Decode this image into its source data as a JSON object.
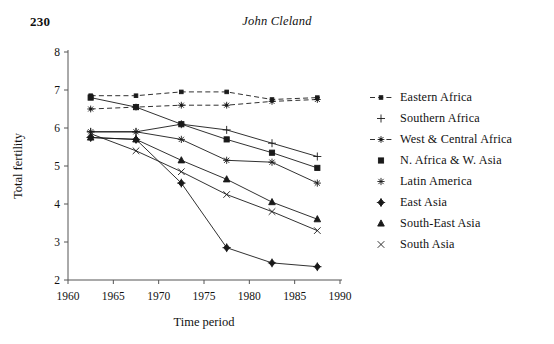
{
  "page": {
    "number": "230",
    "running_title": "John Cleland"
  },
  "chart_data": {
    "type": "line",
    "title": "",
    "xlabel": "Time period",
    "ylabel": "Total fertility",
    "xlim": [
      1960,
      1990
    ],
    "ylim": [
      2,
      8
    ],
    "xticks": [
      "1960",
      "1965",
      "1970",
      "1975",
      "1980",
      "1985",
      "1990"
    ],
    "yticks": [
      "2",
      "3",
      "4",
      "5",
      "6",
      "7",
      "8"
    ],
    "grid": false,
    "legend_position": "right",
    "x": [
      1962.5,
      1967.5,
      1972.5,
      1977.5,
      1982.5,
      1987.5
    ],
    "series": [
      {
        "name": "Eastern Africa",
        "marker": "small-square-dash",
        "linestyle": "dashed",
        "values": [
          6.85,
          6.85,
          6.95,
          6.95,
          6.75,
          6.8
        ]
      },
      {
        "name": "Southern Africa",
        "marker": "plus",
        "linestyle": "solid",
        "values": [
          5.9,
          5.9,
          6.1,
          5.95,
          5.6,
          5.25
        ]
      },
      {
        "name": "West & Central Africa",
        "marker": "asterisk",
        "linestyle": "dashed",
        "values": [
          6.5,
          6.55,
          6.6,
          6.6,
          6.7,
          6.75
        ]
      },
      {
        "name": "N. Africa & W. Asia",
        "marker": "filled-square",
        "linestyle": "solid",
        "values": [
          6.8,
          6.55,
          6.1,
          5.7,
          5.35,
          4.95
        ]
      },
      {
        "name": "Latin America",
        "marker": "open-asterisk",
        "linestyle": "solid",
        "values": [
          5.9,
          5.9,
          5.7,
          5.15,
          5.1,
          4.55
        ]
      },
      {
        "name": "East Asia",
        "marker": "filled-diamond",
        "linestyle": "solid",
        "values": [
          5.75,
          5.7,
          4.55,
          2.85,
          2.45,
          2.35
        ]
      },
      {
        "name": "South-East Asia",
        "marker": "filled-triangle",
        "linestyle": "solid",
        "values": [
          5.75,
          5.7,
          5.15,
          4.65,
          4.05,
          3.6
        ]
      },
      {
        "name": "South Asia",
        "marker": "cross-star",
        "linestyle": "solid",
        "values": [
          5.85,
          5.4,
          4.85,
          4.25,
          3.8,
          3.3
        ]
      }
    ]
  },
  "colors": {
    "ink": "#1a1a1a",
    "axis": "#555555",
    "background": "#ffffff"
  }
}
